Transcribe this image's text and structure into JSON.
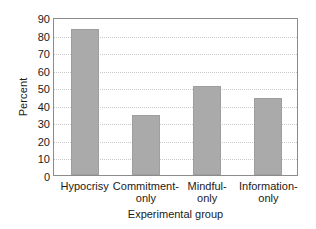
{
  "chart_data": {
    "type": "bar",
    "title": "",
    "xlabel": "Experimental group",
    "ylabel": "Percent",
    "categories": [
      "Hypocrisy",
      "Commitment-only",
      "Mindful-only",
      "Information-only"
    ],
    "category_lines": [
      [
        "Hypocrisy",
        ""
      ],
      [
        "Commitment-",
        "only"
      ],
      [
        "Mindful-",
        "only"
      ],
      [
        "Information-",
        "only"
      ]
    ],
    "values": [
      83,
      34,
      50.5,
      44
    ],
    "ylim": [
      0,
      90
    ],
    "yticks": [
      0,
      10,
      20,
      30,
      40,
      50,
      60,
      70,
      80,
      90
    ],
    "ytick_labels": [
      "0",
      "10",
      "20",
      "30",
      "40",
      "50",
      "60",
      "70",
      "80",
      "90"
    ],
    "grid": true,
    "grid_axis": "y",
    "legend": false,
    "bar_color": "#aaaaaa",
    "bar_edge_color": "#9e9e9e",
    "grid_color": "#c9c9c9",
    "frame_color": "#8c8c8c",
    "text_color": "#1a1a1a"
  }
}
